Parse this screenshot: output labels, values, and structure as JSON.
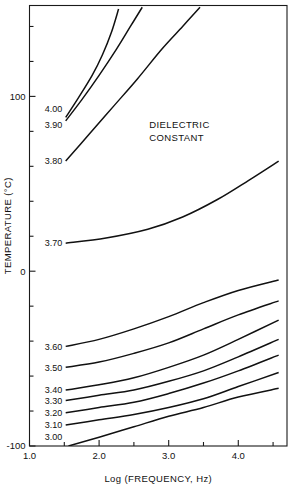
{
  "chart_data": {
    "type": "line",
    "title": "",
    "xlabel": "Log (FREQUENCY, Hz)",
    "ylabel": "TEMPERATURE (°C)",
    "xlim": [
      1.0,
      4.7
    ],
    "ylim": [
      -100,
      152
    ],
    "grid": false,
    "legend_position": "inline-left-labels",
    "annotations": [
      {
        "text_line1": "DIELECTRIC",
        "text_line2": "CONSTANT",
        "x": 2.72,
        "y": 82
      }
    ],
    "xticks_major": [
      "1.0",
      "2.0",
      "3.0",
      "4.0"
    ],
    "xticks_major_values": [
      1.0,
      2.0,
      3.0,
      4.0
    ],
    "xticks_minor_values": [
      1.5,
      2.5,
      3.5,
      4.5
    ],
    "yticks_major": [
      "100",
      "0",
      "-100"
    ],
    "yticks_major_values": [
      100,
      0,
      -100
    ],
    "yticks_minor_values": [
      140,
      120,
      80,
      60,
      40,
      20,
      -20,
      -40,
      -60,
      -80
    ],
    "series_label_name": "Dielectric constant",
    "series": [
      {
        "name": "4.00",
        "label": "4.00",
        "label_x": 1.22,
        "label_y": 93,
        "points": [
          [
            1.52,
            88
          ],
          [
            1.7,
            99
          ],
          [
            1.9,
            112
          ],
          [
            2.05,
            124
          ],
          [
            2.18,
            137
          ],
          [
            2.28,
            150
          ]
        ]
      },
      {
        "name": "3.90",
        "label": "3.90",
        "label_x": 1.22,
        "label_y": 84,
        "points": [
          [
            1.52,
            86
          ],
          [
            1.75,
            98
          ],
          [
            2.0,
            112
          ],
          [
            2.25,
            127
          ],
          [
            2.45,
            140
          ],
          [
            2.62,
            151
          ]
        ]
      },
      {
        "name": "3.80",
        "label": "3.80",
        "label_x": 1.22,
        "label_y": 63,
        "points": [
          [
            1.52,
            63
          ],
          [
            1.85,
            78
          ],
          [
            2.2,
            94
          ],
          [
            2.55,
            110
          ],
          [
            2.9,
            127
          ],
          [
            3.2,
            140
          ],
          [
            3.45,
            151
          ]
        ]
      },
      {
        "name": "3.70",
        "label": "3.70",
        "label_x": 1.22,
        "label_y": 16,
        "points": [
          [
            1.52,
            16
          ],
          [
            2.1,
            19
          ],
          [
            2.7,
            24
          ],
          [
            3.2,
            31
          ],
          [
            3.7,
            41
          ],
          [
            4.15,
            52
          ],
          [
            4.58,
            63
          ]
        ]
      },
      {
        "name": "3.60",
        "label": "3.60",
        "label_x": 1.22,
        "label_y": -43,
        "points": [
          [
            1.52,
            -43
          ],
          [
            2.0,
            -39
          ],
          [
            2.5,
            -33
          ],
          [
            3.0,
            -26
          ],
          [
            3.5,
            -18
          ],
          [
            4.0,
            -11
          ],
          [
            4.58,
            -5
          ]
        ]
      },
      {
        "name": "3.50",
        "label": "3.50",
        "label_x": 1.22,
        "label_y": -55,
        "points": [
          [
            1.52,
            -55
          ],
          [
            2.0,
            -52
          ],
          [
            2.5,
            -47
          ],
          [
            3.0,
            -41
          ],
          [
            3.5,
            -33
          ],
          [
            4.0,
            -25
          ],
          [
            4.58,
            -17
          ]
        ]
      },
      {
        "name": "3.40",
        "label": "3.40",
        "label_x": 1.22,
        "label_y": -68,
        "points": [
          [
            1.52,
            -68
          ],
          [
            2.0,
            -65
          ],
          [
            2.5,
            -61
          ],
          [
            3.0,
            -55
          ],
          [
            3.5,
            -48
          ],
          [
            4.0,
            -39
          ],
          [
            4.58,
            -28
          ]
        ]
      },
      {
        "name": "3.30",
        "label": "3.30",
        "label_x": 1.22,
        "label_y": -74,
        "points": [
          [
            1.52,
            -74
          ],
          [
            2.0,
            -71
          ],
          [
            2.5,
            -68
          ],
          [
            3.0,
            -63
          ],
          [
            3.5,
            -57
          ],
          [
            4.0,
            -49
          ],
          [
            4.58,
            -39
          ]
        ]
      },
      {
        "name": "3.20",
        "label": "3.20",
        "label_x": 1.22,
        "label_y": -81,
        "points": [
          [
            1.52,
            -81
          ],
          [
            2.0,
            -78
          ],
          [
            2.5,
            -75
          ],
          [
            3.0,
            -70
          ],
          [
            3.5,
            -64
          ],
          [
            4.0,
            -57
          ],
          [
            4.58,
            -48
          ]
        ]
      },
      {
        "name": "3.10",
        "label": "3.10",
        "label_x": 1.22,
        "label_y": -88,
        "points": [
          [
            1.52,
            -88
          ],
          [
            2.0,
            -85
          ],
          [
            2.5,
            -82
          ],
          [
            3.0,
            -78
          ],
          [
            3.5,
            -73
          ],
          [
            4.0,
            -66
          ],
          [
            4.58,
            -58
          ]
        ]
      },
      {
        "name": "3.00",
        "label": "3.00",
        "label_x": 1.22,
        "label_y": -95,
        "points": [
          [
            1.56,
            -100
          ],
          [
            2.0,
            -95
          ],
          [
            2.5,
            -89
          ],
          [
            3.0,
            -83
          ],
          [
            3.5,
            -78
          ],
          [
            4.0,
            -72
          ],
          [
            4.58,
            -67
          ]
        ]
      }
    ]
  }
}
